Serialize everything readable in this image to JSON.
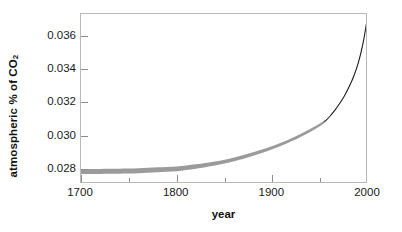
{
  "chart_data": {
    "type": "line",
    "title": "",
    "xlabel": "year",
    "ylabel": "atmospheric % of CO",
    "ylabel_sub": "2",
    "xlim": [
      1700,
      2000
    ],
    "ylim": [
      0.0271,
      0.0373
    ],
    "xticks": [
      1700,
      1800,
      1900,
      2000
    ],
    "xticklabels": [
      "1700",
      "1800",
      "1900",
      "2000"
    ],
    "xminorticks": [
      1750,
      1850,
      1950
    ],
    "yticks": [
      0.028,
      0.03,
      0.032,
      0.034,
      0.036
    ],
    "yticklabels": [
      "0.028",
      "0.030",
      "0.032",
      "0.034",
      "0.036"
    ],
    "grid": false,
    "legend": "none",
    "series": [
      {
        "name": "ice core record (uncertainty band)",
        "style": "band",
        "color": "#9b9b9b",
        "x": [
          1700,
          1710,
          1720,
          1730,
          1740,
          1750,
          1760,
          1770,
          1780,
          1790,
          1800,
          1810,
          1820,
          1830,
          1840,
          1850,
          1860,
          1870,
          1880,
          1890,
          1900,
          1910,
          1920,
          1930,
          1940,
          1950,
          1955
        ],
        "y_upper": [
          0.028,
          0.028,
          0.028,
          0.02801,
          0.02802,
          0.02803,
          0.02805,
          0.02807,
          0.0281,
          0.02812,
          0.02815,
          0.02821,
          0.02828,
          0.02836,
          0.02845,
          0.02856,
          0.02869,
          0.02884,
          0.029,
          0.02918,
          0.02938,
          0.0296,
          0.02985,
          0.03012,
          0.03042,
          0.03075,
          0.03094
        ],
        "y_lower": [
          0.0277,
          0.0277,
          0.0277,
          0.02771,
          0.02772,
          0.02773,
          0.02775,
          0.02777,
          0.0278,
          0.02783,
          0.02787,
          0.02794,
          0.02802,
          0.02811,
          0.02821,
          0.02833,
          0.02847,
          0.02862,
          0.02879,
          0.02898,
          0.02918,
          0.02941,
          0.02966,
          0.02994,
          0.03024,
          0.03058,
          0.03078
        ]
      },
      {
        "name": "instrumental record",
        "style": "line",
        "color": "#1c1c1c",
        "x": [
          1955,
          1960,
          1965,
          1970,
          1975,
          1980,
          1985,
          1990,
          1995,
          2000
        ],
        "y": [
          0.03086,
          0.03115,
          0.0315,
          0.0319,
          0.03235,
          0.0329,
          0.03355,
          0.0344,
          0.0356,
          0.0373
        ]
      }
    ],
    "annotations": []
  },
  "axis": {
    "frame_color": "#b9b9b9",
    "tick_color": "#8d8d8d",
    "text_color": "#1a1a1a",
    "background": "#ffffff"
  }
}
